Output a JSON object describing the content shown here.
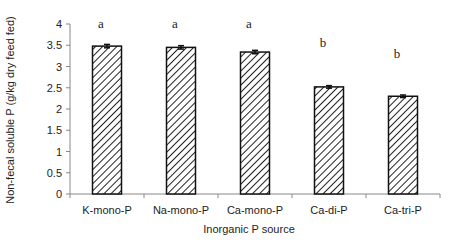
{
  "chart_data": {
    "type": "bar",
    "title": "",
    "xlabel": "Inorganic P source",
    "ylabel": "Non-fecal soluble P (g/kg dry feed fed)",
    "categories": [
      "K-mono-P",
      "Na-mono-P",
      "Ca-mono-P",
      "Ca-di-P",
      "Ca-tri-P"
    ],
    "values": [
      3.48,
      3.45,
      3.34,
      2.52,
      2.3
    ],
    "error": [
      0.04,
      0.04,
      0.04,
      0.03,
      0.03
    ],
    "significance_letters": [
      "a",
      "a",
      "a",
      "b",
      "b"
    ],
    "significance_y": [
      4.0,
      4.0,
      4.0,
      3.55,
      3.3
    ],
    "ylim": [
      0,
      4
    ],
    "yticks": [
      0,
      0.5,
      1,
      1.5,
      2,
      2.5,
      3,
      3.5,
      4
    ],
    "ytick_labels": [
      "0",
      "0.5",
      "1",
      "1.5",
      "2",
      "2.5",
      "3",
      "3.5",
      "4"
    ],
    "grid": false,
    "legend": null,
    "bar_fill": "diagonal-hatch",
    "bar_color": "#222222"
  }
}
